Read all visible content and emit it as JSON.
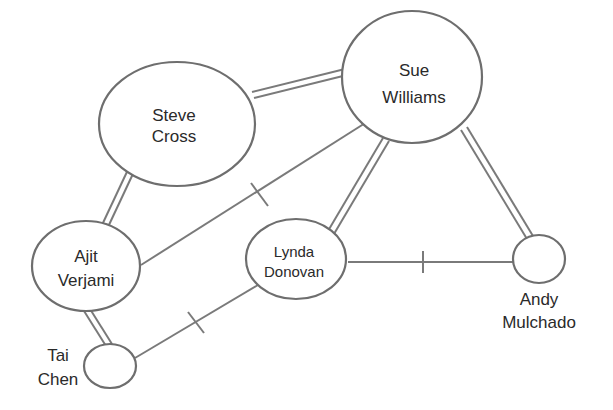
{
  "diagram": {
    "type": "social network / relationship diagram",
    "nodes": [
      {
        "id": "steve",
        "line1": "Steve",
        "line2": "Cross"
      },
      {
        "id": "sue",
        "line1": "Sue",
        "line2": "Williams"
      },
      {
        "id": "ajit",
        "line1": "Ajit",
        "line2": "Verjami"
      },
      {
        "id": "lynda",
        "line1": "Lynda",
        "line2": "Donovan"
      },
      {
        "id": "andy",
        "line1": "Andy",
        "line2": "Mulchado"
      },
      {
        "id": "tai",
        "line1": "Tai",
        "line2": "Chen"
      }
    ],
    "edges": [
      {
        "from": "steve",
        "to": "sue",
        "style": "double"
      },
      {
        "from": "steve",
        "to": "ajit",
        "style": "double"
      },
      {
        "from": "sue",
        "to": "ajit",
        "style": "single-negative"
      },
      {
        "from": "sue",
        "to": "lynda",
        "style": "double"
      },
      {
        "from": "sue",
        "to": "andy",
        "style": "double"
      },
      {
        "from": "lynda",
        "to": "andy",
        "style": "single-negative"
      },
      {
        "from": "ajit",
        "to": "tai",
        "style": "double"
      },
      {
        "from": "tai",
        "to": "lynda",
        "style": "single-negative"
      }
    ],
    "colors": {
      "line": "#7a7a7a",
      "text": "#2a2a2a",
      "background": "#ffffff"
    }
  }
}
